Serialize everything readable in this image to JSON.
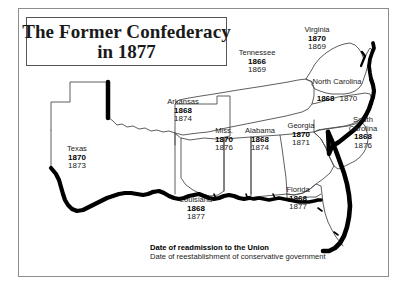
{
  "figure": {
    "title_line_1": "The Former Confederacy",
    "title_line_2": "in 1877"
  },
  "legend": {
    "readmission": "Date of readmission to the Union",
    "conservative": "Date of reestablishment of conservative government"
  },
  "states": [
    {
      "id": "texas",
      "name": "Texas",
      "name2": "",
      "readmission_year": "1870",
      "conservative_year": "1873",
      "inline": false
    },
    {
      "id": "arkansas",
      "name": "Arkansas",
      "name2": "",
      "readmission_year": "1868",
      "conservative_year": "1874",
      "inline": false
    },
    {
      "id": "louisiana",
      "name": "Louisiana",
      "name2": "",
      "readmission_year": "1868",
      "conservative_year": "1877",
      "inline": false
    },
    {
      "id": "mississippi",
      "name": "Miss.",
      "name2": "",
      "readmission_year": "1870",
      "conservative_year": "1876",
      "inline": false
    },
    {
      "id": "alabama",
      "name": "Alabama",
      "name2": "",
      "readmission_year": "1868",
      "conservative_year": "1874",
      "inline": false
    },
    {
      "id": "tennessee",
      "name": "Tennessee",
      "name2": "",
      "readmission_year": "1866",
      "conservative_year": "1869",
      "inline": false
    },
    {
      "id": "georgia",
      "name": "Georgia",
      "name2": "",
      "readmission_year": "1870",
      "conservative_year": "1871",
      "inline": false
    },
    {
      "id": "florida",
      "name": "Florida",
      "name2": "",
      "readmission_year": "1868",
      "conservative_year": "1877",
      "inline": false
    },
    {
      "id": "south-carolina",
      "name": "South",
      "name2": "Carolina",
      "readmission_year": "1868",
      "conservative_year": "1876",
      "inline": false
    },
    {
      "id": "north-carolina",
      "name": "North Carolina",
      "name2": "",
      "readmission_year": "1868",
      "conservative_year": "1870",
      "inline": true
    },
    {
      "id": "virginia",
      "name": "Virginia",
      "name2": "",
      "readmission_year": "1870",
      "conservative_year": "1869",
      "inline": false
    }
  ],
  "colors": {
    "frame": "#8c8c8c",
    "title_border": "#555555",
    "state_outline": "#4d4d4d",
    "coastline": "#000000",
    "text": "#1a1a1a",
    "background": "#ffffff"
  }
}
